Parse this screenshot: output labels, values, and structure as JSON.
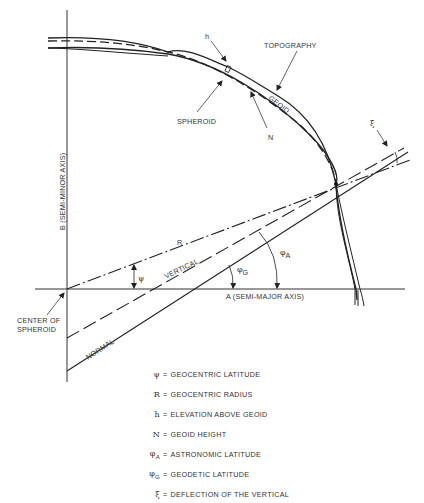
{
  "diagram": {
    "labels": {
      "h": "h",
      "topography": "TOPOGRAPHY",
      "geoid": "GEOID",
      "spheroid": "SPHEROID",
      "n": "N",
      "xi": "ξ",
      "semi_minor_axis": "B (SEMI-MINOR AXIS)",
      "semi_major_axis": "A (SEMI-MAJOR AXIS)",
      "r": "R",
      "psi": "ψ",
      "vertical": "VERTICAL",
      "normal": "NORMAL",
      "phi_a_base": "φ",
      "phi_a_sub": "A",
      "phi_g_base": "φ",
      "phi_g_sub": "G",
      "center_line1": "CENTER OF",
      "center_line2": "SPHEROID"
    },
    "legend": [
      {
        "symbol": "ψ",
        "sub": "",
        "text": "GEOCENTRIC LATITUDE"
      },
      {
        "symbol": "R",
        "sub": "",
        "text": "GEOCENTRIC RADIUS"
      },
      {
        "symbol": "h",
        "sub": "",
        "text": "ELEVATION ABOVE GEOID"
      },
      {
        "symbol": "N",
        "sub": "",
        "text": "GEOID HEIGHT"
      },
      {
        "symbol": "φ",
        "sub": "A",
        "text": "ASTRONOMIC LATITUDE"
      },
      {
        "symbol": "φ",
        "sub": "G",
        "text": "GEODETIC LATITUDE"
      },
      {
        "symbol": "ξ",
        "sub": "",
        "text": "DEFLECTION OF THE VERTICAL"
      }
    ],
    "legend_equals": "="
  }
}
